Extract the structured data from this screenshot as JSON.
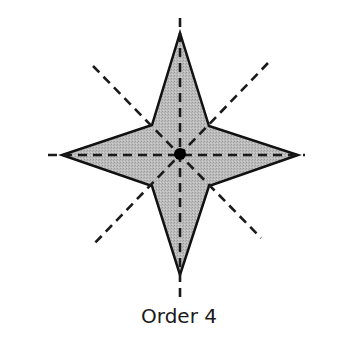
{
  "figure": {
    "caption": "Order 4",
    "colors": {
      "fill": "#b8b8b8",
      "outline": "#111111",
      "symmetry_line": "#1a1a1a",
      "center_dot": "#000000"
    },
    "star": {
      "center": [
        180,
        154
      ],
      "outer_points": {
        "top": [
          180,
          33
        ],
        "right": [
          298,
          155
        ],
        "bottom": [
          180,
          275
        ],
        "left": [
          62,
          155
        ]
      },
      "inner_points": {
        "top_right": [
          209,
          126
        ],
        "bottom_right": [
          209,
          186
        ],
        "bottom_left": [
          152,
          186
        ],
        "top_left": [
          152,
          125
        ]
      }
    },
    "symmetry_lines": [
      {
        "name": "vertical",
        "from": [
          180,
          18
        ],
        "to": [
          180,
          302
        ]
      },
      {
        "name": "horizontal",
        "from": [
          48,
          155
        ],
        "to": [
          305,
          155
        ]
      },
      {
        "name": "diagonal-main",
        "from": [
          93,
          66
        ],
        "to": [
          261,
          238
        ]
      },
      {
        "name": "diagonal-anti",
        "from": [
          268,
          63
        ],
        "to": [
          92,
          246
        ]
      }
    ],
    "center_dot_radius": 6
  }
}
